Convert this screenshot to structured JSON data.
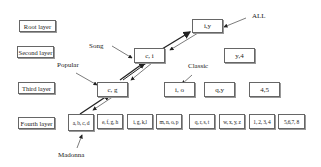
{
  "layers": {
    "root": "Root layer",
    "second": "Second layer",
    "third": "Third layer",
    "fourth": "Fourth layer"
  },
  "root_nodes": [
    "i,y"
  ],
  "second_nodes": [
    "c, i",
    "y,4"
  ],
  "third_nodes": [
    "c, g",
    "i, o",
    "q,y",
    "4,5"
  ],
  "fourth_nodes": [
    "a, b, c, d",
    "e, f, g, h",
    "i, g, k,l",
    "m, n, o, p",
    "q, r, s, t",
    "w, x, y, z",
    "1, 2, 3, 4",
    "5,6,7, 8"
  ],
  "annotations": {
    "all": "ALL",
    "song": "Song",
    "popular": "Popular",
    "classic": "Classic",
    "madonna": "Madonna"
  }
}
